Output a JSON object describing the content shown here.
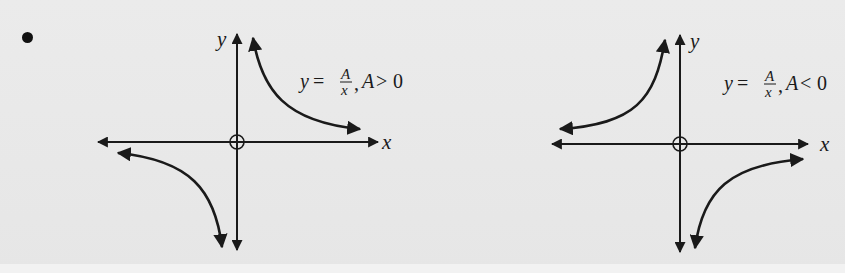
{
  "bullet": "•",
  "graphs": [
    {
      "id": "positive",
      "x_axis_label": "x",
      "y_axis_label": "y",
      "equation": {
        "lhs": "y",
        "equals": "=",
        "numerator": "A",
        "denominator": "x",
        "separator": ",",
        "condition_var": "A",
        "condition_op": ">",
        "condition_val": "0"
      },
      "branches": [
        "quadrant I",
        "quadrant III"
      ]
    },
    {
      "id": "negative",
      "x_axis_label": "x",
      "y_axis_label": "y",
      "equation": {
        "lhs": "y",
        "equals": "=",
        "numerator": "A",
        "denominator": "x",
        "separator": ",",
        "condition_var": "A",
        "condition_op": "<",
        "condition_val": "0"
      },
      "branches": [
        "quadrant II",
        "quadrant IV"
      ]
    }
  ],
  "colors": {
    "ink": "#1a1a1a",
    "background": "#e9e9e9"
  }
}
